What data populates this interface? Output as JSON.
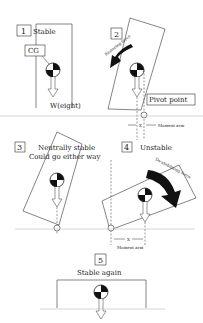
{
  "panels": [
    {
      "number": "1",
      "title": "Stable",
      "cg_label": "CG",
      "weight_label": "W(eight)"
    },
    {
      "number": "2",
      "force_label": "Restoring force",
      "pivot_label": "Pivot point",
      "arm_x": "X",
      "arm_label": "Moment arm"
    },
    {
      "number": "3",
      "title_line1": "Neutrally stable",
      "title_line2": "Could go either way"
    },
    {
      "number": "4",
      "title": "Unstable",
      "force_label": "De-stabilising force",
      "arm_x": "X",
      "arm_label": "Moment arm"
    },
    {
      "number": "5",
      "title": "Stable again"
    }
  ],
  "colors": {
    "line": "#333333",
    "ground": "#bbbbbb",
    "arrow": "#111111"
  }
}
